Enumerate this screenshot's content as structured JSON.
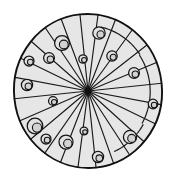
{
  "figure": {
    "type": "line-diagram",
    "width": 174,
    "height": 181,
    "background_color": "#ffffff"
  },
  "colors": {
    "outline": "#111111",
    "spoke": "#1a1a1a",
    "sector_fill": "#e6e6e6",
    "cell_outline": "#141414",
    "cell_fill": "#e2e2e2",
    "cell_inner_fill": "#d2d2d2",
    "hub": "#111111"
  },
  "circle": {
    "center_x": 88,
    "center_y": 91,
    "radius_x": 74,
    "radius_y": 77,
    "rotation_deg": -6,
    "outline_width": 1.9
  },
  "hub": {
    "radius": 3.2
  },
  "sectors": {
    "count": 23,
    "spoke_angles_deg": [
      0,
      16,
      31,
      47,
      62,
      76,
      90,
      104,
      118,
      132,
      147,
      163,
      180,
      196,
      211,
      226,
      241,
      255,
      270,
      284,
      298,
      313,
      329,
      344
    ]
  },
  "band_arcs": [
    {
      "name": "upper-right-rim-band",
      "radius_scale": 0.84,
      "start_deg": 332,
      "end_deg": 36
    },
    {
      "name": "right-rim-band",
      "radius_scale": 0.86,
      "start_deg": 36,
      "end_deg": 72
    },
    {
      "name": "lower-right-rim-band",
      "radius_scale": 0.85,
      "start_deg": 288,
      "end_deg": 332
    }
  ],
  "cells": [
    {
      "id": "c01",
      "cx": 99,
      "cy": 33,
      "r": 6.2,
      "inner_cx": 100.6,
      "inner_cy": 34.4,
      "inner_r": 3.6
    },
    {
      "id": "c02",
      "cx": 62,
      "cy": 43,
      "r": 7.4,
      "inner_cx": 63.8,
      "inner_cy": 44.5,
      "inner_r": 4.4
    },
    {
      "id": "c03",
      "cx": 49,
      "cy": 58,
      "r": 5.4,
      "inner_cx": 50.4,
      "inner_cy": 59.2,
      "inner_r": 3.2
    },
    {
      "id": "c04",
      "cx": 29,
      "cy": 61,
      "r": 5.0,
      "inner_cx": 30.3,
      "inner_cy": 62.1,
      "inner_r": 2.9
    },
    {
      "id": "c05",
      "cx": 27,
      "cy": 85,
      "r": 5.6,
      "inner_cx": 28.4,
      "inner_cy": 86.3,
      "inner_r": 3.3
    },
    {
      "id": "c06",
      "cx": 83,
      "cy": 59,
      "r": 4.2,
      "inner_cx": 84.1,
      "inner_cy": 60.0,
      "inner_r": 2.5
    },
    {
      "id": "c07",
      "cx": 112,
      "cy": 56,
      "r": 5.2,
      "inner_cx": 113.2,
      "inner_cy": 57.2,
      "inner_r": 3.0
    },
    {
      "id": "c08",
      "cx": 134,
      "cy": 73,
      "r": 5.4,
      "inner_cx": 135.3,
      "inner_cy": 74.2,
      "inner_r": 3.2
    },
    {
      "id": "c09",
      "cx": 153,
      "cy": 104,
      "r": 4.8,
      "inner_cx": 154.1,
      "inner_cy": 105.1,
      "inner_r": 2.8
    },
    {
      "id": "c10",
      "cx": 53,
      "cy": 101,
      "r": 4.4,
      "inner_cx": 54.1,
      "inner_cy": 102.1,
      "inner_r": 2.6
    },
    {
      "id": "c11",
      "cx": 35,
      "cy": 126,
      "r": 7.8,
      "inner_cx": 37.0,
      "inner_cy": 127.6,
      "inner_r": 4.6
    },
    {
      "id": "c12",
      "cx": 46,
      "cy": 139,
      "r": 5.0,
      "inner_cx": 47.2,
      "inner_cy": 140.2,
      "inner_r": 2.9
    },
    {
      "id": "c13",
      "cx": 66,
      "cy": 142,
      "r": 7.0,
      "inner_cx": 67.8,
      "inner_cy": 143.5,
      "inner_r": 4.2
    },
    {
      "id": "c14",
      "cx": 84,
      "cy": 131,
      "r": 3.9,
      "inner_cx": 85.0,
      "inner_cy": 132.0,
      "inner_r": 2.3
    },
    {
      "id": "c15",
      "cx": 98,
      "cy": 157,
      "r": 5.6,
      "inner_cx": 99.3,
      "inner_cy": 158.2,
      "inner_r": 3.3
    },
    {
      "id": "c16",
      "cx": 130,
      "cy": 137,
      "r": 6.6,
      "inner_cx": 131.7,
      "inner_cy": 138.4,
      "inner_r": 4.0
    }
  ]
}
